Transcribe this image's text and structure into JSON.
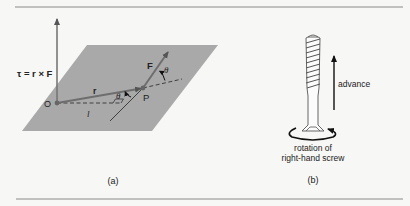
{
  "figure": {
    "panel_a": {
      "equation": "τ = r × F",
      "origin_label": "O",
      "point_label": "P",
      "r_label": "r",
      "force_label": "F",
      "theta_label_1": "θ",
      "theta_label_2": "θ",
      "lever_arm_label": "l",
      "caption": "(a)"
    },
    "panel_b": {
      "advance_label": "advance",
      "rotation_label_line1": "rotation of",
      "rotation_label_line2": "right-hand screw",
      "caption": "(b)"
    },
    "colors": {
      "plane": "#a9a9a9",
      "vector": "#6e6e6e",
      "line": "#333333",
      "rule": "#8a8a8a",
      "background": "#f7f7f5"
    }
  }
}
